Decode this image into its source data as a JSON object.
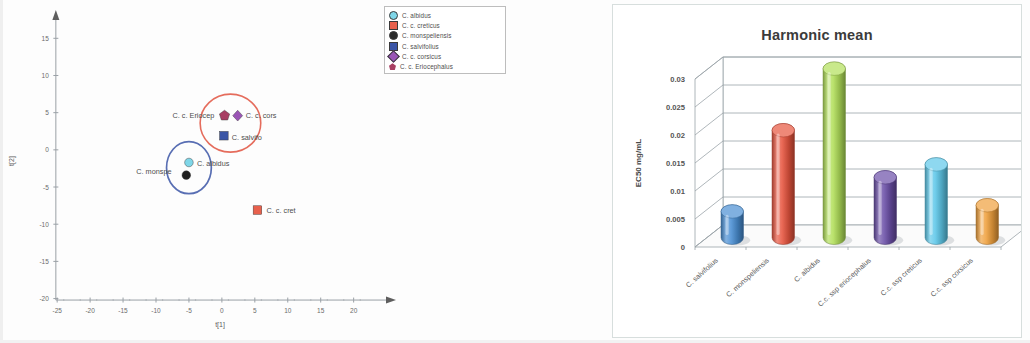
{
  "scatter": {
    "x_axis": {
      "title": "t[1]",
      "ticks": [
        "-25",
        "-20",
        "-15",
        "-10",
        "-5",
        "0",
        "5",
        "10",
        "15",
        "20"
      ],
      "min": -27,
      "max": 24
    },
    "y_axis": {
      "title": "t[2]",
      "ticks": [
        "15",
        "10",
        "5",
        "0",
        "-5",
        "-10",
        "-15",
        "-20"
      ],
      "min": -21,
      "max": 18
    },
    "legend": [
      {
        "label": "C. albidus",
        "color": "#7fd6e8",
        "shape": "circle"
      },
      {
        "label": "C. c. creticus",
        "color": "#e8604c",
        "shape": "square"
      },
      {
        "label": "C. monspeliensis",
        "color": "#2b2b2b",
        "shape": "circle"
      },
      {
        "label": "C. salvifolius",
        "color": "#3b55a6",
        "shape": "square"
      },
      {
        "label": "C. c. corsicus",
        "color": "#9a55b5",
        "shape": "diamond"
      },
      {
        "label": "C. c. Eriocephalus",
        "color": "#a83f63",
        "shape": "pentagon"
      }
    ],
    "points": [
      {
        "name": "C. c. Eriocephalus",
        "label": "C. c. Eriocep",
        "x": 0.4,
        "y": 4.6,
        "color": "#a83f63",
        "shape": "pentagon",
        "label_dx": -52,
        "label_dy": 2
      },
      {
        "name": "C. c. corsicus",
        "label": "C. c. cors",
        "x": 2.4,
        "y": 4.6,
        "color": "#9a55b5",
        "shape": "diamond",
        "label_dx": 8,
        "label_dy": 2
      },
      {
        "name": "C. salvifolius",
        "label": "C. salvifo",
        "x": 0.3,
        "y": 1.9,
        "color": "#3b55a6",
        "shape": "square",
        "label_dx": 8,
        "label_dy": 4
      },
      {
        "name": "C. albidus",
        "label": "C. albidus",
        "x": -5.0,
        "y": -1.7,
        "color": "#7fd6e8",
        "shape": "circle",
        "label_dx": 8,
        "label_dy": 4
      },
      {
        "name": "C. monspeliensis",
        "label": "C. monspe",
        "x": -5.4,
        "y": -3.4,
        "color": "#1f1f1f",
        "shape": "circle",
        "label_dx": -50,
        "label_dy": -1
      },
      {
        "name": "C. c. creticus",
        "label": "C. c. cret",
        "x": 5.4,
        "y": -8.1,
        "color": "#e8604c",
        "shape": "square",
        "label_dx": 9,
        "label_dy": 3
      }
    ],
    "clusters": [
      {
        "name": "red-cluster",
        "cx": 1.3,
        "cy": 3.6,
        "rx": 4.6,
        "ry": 3.9,
        "color": "#e0523f"
      },
      {
        "name": "blue-cluster",
        "cx": -5.0,
        "cy": -2.4,
        "rx": 3.4,
        "ry": 3.5,
        "color": "#3b55a6"
      }
    ]
  },
  "bar": {
    "title": "Harmonic mean",
    "chart_caption": "Harmonic mean"
  },
  "chart_data": [
    {
      "type": "scatter",
      "title": "",
      "xlabel": "t[1]",
      "ylabel": "t[2]",
      "xlim": [
        -27,
        24
      ],
      "ylim": [
        -21,
        18
      ],
      "grid": false,
      "legend_position": "top-right",
      "series": [
        {
          "name": "C. albidus",
          "x": [
            -5.0
          ],
          "y": [
            -1.7
          ]
        },
        {
          "name": "C. c. creticus",
          "x": [
            5.4
          ],
          "y": [
            -8.1
          ]
        },
        {
          "name": "C. monspeliensis",
          "x": [
            -5.4
          ],
          "y": [
            -3.4
          ]
        },
        {
          "name": "C. salvifolius",
          "x": [
            0.3
          ],
          "y": [
            1.9
          ]
        },
        {
          "name": "C. c. corsicus",
          "x": [
            2.4
          ],
          "y": [
            4.6
          ]
        },
        {
          "name": "C. c. Eriocephalus",
          "x": [
            0.4
          ],
          "y": [
            4.6
          ]
        }
      ],
      "annotations": [
        "C. c. Eriocep",
        "C. c. cors",
        "C. salvifo",
        "C. albidus",
        "C. monspe",
        "C. c. cret"
      ]
    },
    {
      "type": "bar",
      "title": "Harmonic mean",
      "xlabel": "",
      "ylabel": "EC50 mg/mL",
      "ylim": [
        0,
        0.03
      ],
      "yticks": [
        0,
        0.005,
        0.01,
        0.015,
        0.02,
        0.025,
        0.03
      ],
      "ytick_labels": [
        "0",
        "0.005",
        "0.01",
        "0.015",
        "0.02",
        "0.025",
        "0.03"
      ],
      "grid": true,
      "categories": [
        "C. salvifolius",
        "C. monspeliensis",
        "C. albidus",
        "C.c. ssp eriocephalus",
        "C.c. ssp creticus",
        "C.c. ssp corsicus"
      ],
      "values": [
        0.0047,
        0.0192,
        0.0302,
        0.0108,
        0.0131,
        0.0058
      ],
      "colors": [
        "#4a8fd4",
        "#e8553f",
        "#b2e05a",
        "#6b4fa8",
        "#5ec8ea",
        "#f0a03c"
      ]
    }
  ]
}
